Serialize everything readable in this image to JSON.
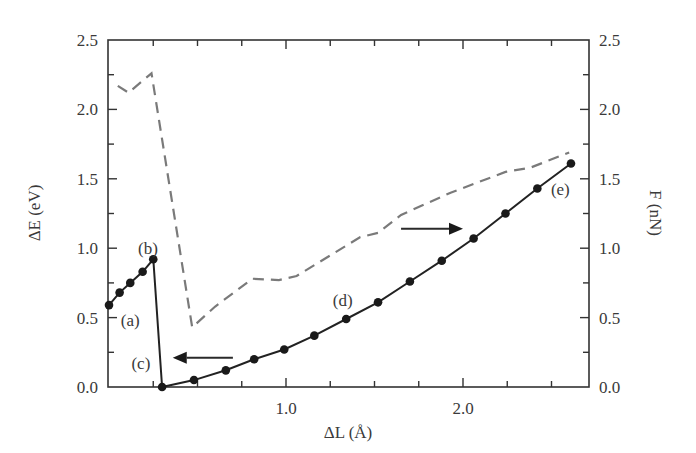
{
  "chart_data": {
    "type": "line",
    "title": "",
    "xlabel": "ΔL (Å)",
    "ylabel": "ΔE (eV)",
    "y2label": "F (nN)",
    "xlim": [
      0,
      2.71
    ],
    "ylim": [
      0,
      2.5
    ],
    "y2lim": [
      0,
      2.5
    ],
    "x_ticks": [
      1.0,
      2.0
    ],
    "x_tick_labels": [
      "1.0",
      "2.0"
    ],
    "y_ticks": [
      0.0,
      0.5,
      1.0,
      1.5,
      2.0,
      2.5
    ],
    "y_tick_labels": [
      "0.0",
      "0.5",
      "1.0",
      "1.5",
      "2.0",
      "2.5"
    ],
    "y2_ticks": [
      0.0,
      0.5,
      1.0,
      1.5,
      2.0,
      2.5
    ],
    "y2_tick_labels": [
      "0.0",
      "0.5",
      "1.0",
      "1.5",
      "2.0",
      "2.5"
    ],
    "grid": false,
    "series": [
      {
        "name": "ΔE (eV)",
        "axis": "left",
        "style": "solid-markers",
        "color": "#222222",
        "x": [
          0.0,
          0.06,
          0.12,
          0.19,
          0.25,
          0.3,
          0.48,
          0.66,
          0.82,
          0.99,
          1.16,
          1.34,
          1.52,
          1.7,
          1.88,
          2.06,
          2.24,
          2.42,
          2.61
        ],
        "y": [
          0.59,
          0.68,
          0.75,
          0.83,
          0.92,
          0.0,
          0.05,
          0.12,
          0.2,
          0.27,
          0.37,
          0.49,
          0.61,
          0.76,
          0.91,
          1.07,
          1.25,
          1.43,
          1.61
        ]
      },
      {
        "name": "F (nN)",
        "axis": "right",
        "style": "dashed",
        "color": "#7a7a7a",
        "x": [
          0.05,
          0.11,
          0.24,
          0.47,
          0.6,
          0.81,
          0.96,
          1.06,
          1.42,
          1.52,
          1.65,
          1.93,
          2.24,
          2.38,
          2.6
        ],
        "y": [
          2.17,
          2.12,
          2.26,
          0.43,
          0.58,
          0.78,
          0.77,
          0.8,
          1.08,
          1.11,
          1.24,
          1.4,
          1.55,
          1.58,
          1.69
        ]
      }
    ],
    "annotations": [
      {
        "text": "(a)",
        "x": 0.12,
        "y": 0.48
      },
      {
        "text": "(b)",
        "x": 0.22,
        "y": 1.0
      },
      {
        "text": "(c)",
        "x": 0.18,
        "y": 0.17
      },
      {
        "text": "(d)",
        "x": 1.32,
        "y": 0.63
      },
      {
        "text": "(e)",
        "x": 2.55,
        "y": 1.43
      }
    ],
    "arrows": [
      {
        "direction": "left",
        "meaning": "ΔE uses left axis",
        "from": [
          0.7,
          0.21
        ],
        "to": [
          0.36,
          0.21
        ]
      },
      {
        "direction": "right",
        "meaning": "F uses right axis",
        "from": [
          1.65,
          1.14
        ],
        "to": [
          2.0,
          1.14
        ]
      }
    ]
  }
}
